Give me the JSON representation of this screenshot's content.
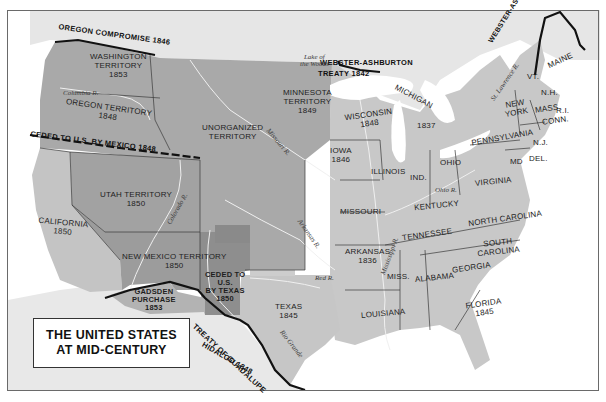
{
  "title": {
    "line1": "THE UNITED STATES",
    "line2": "AT MID-CENTURY"
  },
  "colors": {
    "background_water": "#ffffff",
    "foreign_land": "#e6e6e6",
    "states": "#c8c8c8",
    "territories": "#a6a6a6",
    "cessions_dark": "#8e8e8e",
    "borders": "#333333",
    "treaty_lines": "#111111",
    "rivers": "#f2f2f2"
  },
  "territories": [
    {
      "id": "washington",
      "name": "WASHINGTON\nTERRITORY",
      "line1": "WASHINGTON",
      "line2": "TERRITORY",
      "year": "1853"
    },
    {
      "id": "oregon",
      "name": "OREGON TERRITORY",
      "year": "1848"
    },
    {
      "id": "unorganized",
      "line1": "UNORGANIZED",
      "line2": "TERRITORY",
      "year": ""
    },
    {
      "id": "minnesota",
      "line1": "MINNESOTA",
      "line2": "TERRITORY",
      "year": "1849"
    },
    {
      "id": "utah",
      "name": "UTAH TERRITORY",
      "year": "1850"
    },
    {
      "id": "new-mexico",
      "name": "NEW MEXICO TERRITORY",
      "year": "1850"
    },
    {
      "id": "ceded-texas",
      "line1": "CEDED TO",
      "line2": "U.S.",
      "line3": "BY TEXAS",
      "year": "1850"
    },
    {
      "id": "gadsden",
      "line1": "GADSDEN",
      "line2": "PURCHASE",
      "year": "1853"
    }
  ],
  "states": [
    {
      "id": "california",
      "name": "CALIFORNIA",
      "year": "1850"
    },
    {
      "id": "texas",
      "name": "TEXAS",
      "year": "1845"
    },
    {
      "id": "iowa",
      "name": "IOWA",
      "year": "1846"
    },
    {
      "id": "wisconsin",
      "name": "WISCONSIN",
      "year": "1848"
    },
    {
      "id": "michigan",
      "name": "MICHIGAN",
      "year": "1837"
    },
    {
      "id": "arkansas",
      "name": "ARKANSAS",
      "year": "1836"
    },
    {
      "id": "florida",
      "name": "FLORIDA",
      "year": "1845"
    },
    {
      "id": "missouri",
      "name": "MISSOURI",
      "year": ""
    },
    {
      "id": "illinois",
      "name": "ILLINOIS",
      "year": ""
    },
    {
      "id": "indiana",
      "name": "IND.",
      "year": ""
    },
    {
      "id": "ohio",
      "name": "OHIO",
      "year": ""
    },
    {
      "id": "kentucky",
      "name": "KENTUCKY",
      "year": ""
    },
    {
      "id": "tennessee",
      "name": "TENNESSEE",
      "year": ""
    },
    {
      "id": "louisiana",
      "name": "LOUISIANA",
      "year": ""
    },
    {
      "id": "mississippi",
      "name": "MISS.",
      "year": ""
    },
    {
      "id": "alabama",
      "name": "ALABAMA",
      "year": ""
    },
    {
      "id": "georgia",
      "name": "GEORGIA",
      "year": ""
    },
    {
      "id": "south-carolina",
      "line1": "SOUTH",
      "line2": "CAROLINA",
      "year": ""
    },
    {
      "id": "north-carolina",
      "name": "NORTH CAROLINA",
      "year": ""
    },
    {
      "id": "virginia",
      "name": "VIRGINIA",
      "year": ""
    },
    {
      "id": "pennsylvania",
      "name": "PENNSYLVANIA",
      "year": ""
    },
    {
      "id": "new-york",
      "line1": "NEW",
      "line2": "YORK",
      "year": ""
    },
    {
      "id": "maryland",
      "name": "MD",
      "year": ""
    },
    {
      "id": "delaware",
      "name": "DEL.",
      "year": ""
    },
    {
      "id": "new-jersey",
      "name": "N.J.",
      "year": ""
    },
    {
      "id": "connecticut",
      "name": "CONN.",
      "year": ""
    },
    {
      "id": "rhode-island",
      "name": "R.I.",
      "year": ""
    },
    {
      "id": "massachusetts",
      "name": "MASS.",
      "year": ""
    },
    {
      "id": "new-hampshire",
      "name": "N.H.",
      "year": ""
    },
    {
      "id": "vermont",
      "name": "VT.",
      "year": ""
    },
    {
      "id": "maine",
      "name": "MAINE",
      "year": ""
    }
  ],
  "treaties": {
    "oregon": "OREGON COMPROMISE 1846",
    "mexico_cession": "CEDED TO U.S. BY MEXICO 1848",
    "webster_north_1": "WEBSTER-ASHBURTON",
    "webster_north_2": "TREATY 1842",
    "webster_maine": "WEBSTER-ASHBURTON TREATY 1842",
    "guadalupe_1": "TREATY OF GUADALUPE",
    "guadalupe_2": "HIDALGO 1848"
  },
  "rivers": {
    "columbia_nw": "Columbia R.",
    "colorado": "Colorado R.",
    "missouri": "Missouri R.",
    "arkansas": "Arkansas R.",
    "red": "Red R.",
    "rio_grande": "Rio Grande",
    "mississippi": "Mississippi R.",
    "ohio": "Ohio R.",
    "st_lawrence": "St. Lawrence R.",
    "lake_woods_1": "Lake of",
    "lake_woods_2": "the Woods"
  }
}
